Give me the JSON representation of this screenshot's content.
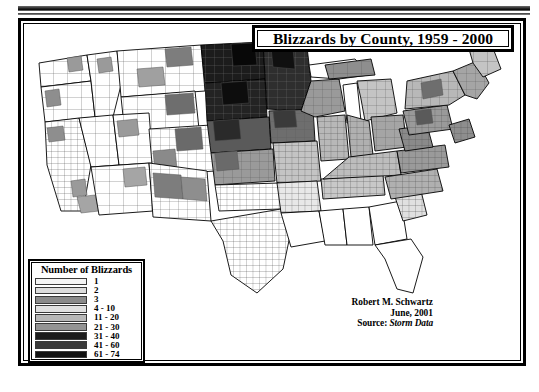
{
  "title": {
    "text": "Blizzards by County, 1959 - 2000"
  },
  "legend": {
    "heading": "Number of Blizzards",
    "entries": [
      {
        "label": "1",
        "color": "#f4f4f4"
      },
      {
        "label": "2",
        "color": "#dcdcdc"
      },
      {
        "label": "3",
        "color": "#8a8a8a"
      },
      {
        "label": "4 - 10",
        "color": "#e0e0e0"
      },
      {
        "label": "11 - 20",
        "color": "#b8b8b8"
      },
      {
        "label": "21 - 30",
        "color": "#949494"
      },
      {
        "label": "31 - 40",
        "color": "#1c1c1c"
      },
      {
        "label": "41 - 60",
        "color": "#3a3a3a"
      },
      {
        "label": "61 - 74",
        "color": "#111111"
      }
    ]
  },
  "credit": {
    "author": "Robert M. Schwartz",
    "date": "June, 2001",
    "source_label": "Source:",
    "source_value": "Storm Data"
  },
  "map": {
    "outline_color": "#000000",
    "county_border_color": "#555555",
    "background": "#ffffff",
    "regions": [
      {
        "name": "pacific-northwest",
        "shade": "#ffffff"
      },
      {
        "name": "california",
        "shade": "#ffffff"
      },
      {
        "name": "great-basin",
        "shade": "#ffffff"
      },
      {
        "name": "northern-plains",
        "shade": "#1c1c1c"
      },
      {
        "name": "upper-midwest",
        "shade": "#3a3a3a"
      },
      {
        "name": "central-plains",
        "shade": "#949494"
      },
      {
        "name": "great-lakes",
        "shade": "#b8b8b8"
      },
      {
        "name": "northeast",
        "shade": "#b8b8b8"
      },
      {
        "name": "appalachia",
        "shade": "#949494"
      },
      {
        "name": "southeast",
        "shade": "#ffffff"
      },
      {
        "name": "texas-south",
        "shade": "#ffffff"
      }
    ]
  }
}
